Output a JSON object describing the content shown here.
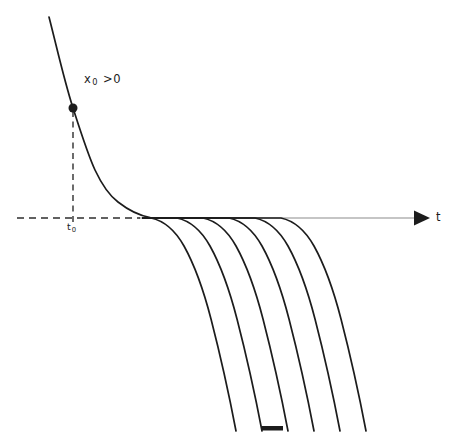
{
  "figure": {
    "type": "ode-solution-curves-diagram",
    "colors": {
      "background": "#ffffff",
      "curve": "#1c1c1c",
      "axis": "#8c8c8c",
      "dashed": "#2e2e2e"
    },
    "labels": {
      "initial_condition": {
        "base": "x",
        "sub": "0",
        "relation": ">0"
      },
      "t0": {
        "base": "t",
        "sub": "0"
      },
      "axis": "t"
    },
    "geometry": {
      "axis_y": 218,
      "axis_x_start": 139,
      "axis_x_end": 416,
      "arrow_points": "414,210.5 414,225.5 430,218",
      "h_dash": {
        "x1": 17,
        "x2": 140,
        "y": 218
      },
      "v_dash": {
        "x": 73,
        "y1": 111,
        "y2": 223
      },
      "point": {
        "cx": 73,
        "cy": 108,
        "r": 4.5
      },
      "main_curve_d": "M 49 17 C 57 48 64 80 73 108 C 82 136 88 155 95 170 C 103 187 110 196 118 202 C 127 209 136 215 150 217.5",
      "flat_start_x": 143,
      "knees": [
        151,
        177,
        203,
        229,
        255,
        281
      ],
      "drop_d": "c 14 3 24 12 33 28 c 10 18 19 42 27 73 c 8 31 17 70 25 112",
      "crop_mark": {
        "x": 262,
        "y": 426,
        "w": 21,
        "h": 4.5
      }
    }
  }
}
